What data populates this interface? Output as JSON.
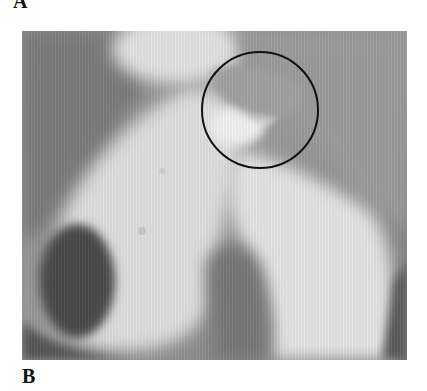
{
  "figure": {
    "panel_top_label": "A",
    "panel_bottom_label": "B",
    "image": {
      "description": "grayscale radiograph with circled region of interest",
      "annotation": "circle-marker"
    },
    "colors": {
      "background": "#8a8a8a",
      "bone": "#e6e6e6",
      "dark_cavity": "#4a4a4a",
      "circle_stroke": "#111111"
    },
    "circle": {
      "cx": 238,
      "cy": 79,
      "r": 59
    }
  }
}
